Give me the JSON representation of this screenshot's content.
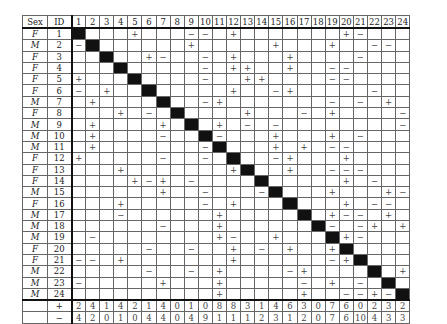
{
  "headers": {
    "sex": "Sex",
    "id": "ID",
    "columns": [
      "1",
      "2",
      "3",
      "4",
      "5",
      "6",
      "7",
      "8",
      "9",
      "10",
      "11",
      "12",
      "13",
      "14",
      "15",
      "16",
      "17",
      "18",
      "19",
      "20",
      "21",
      "22",
      "23",
      "24"
    ]
  },
  "rows": [
    {
      "sex": "F",
      "id": "1",
      "cells": {
        "5": "+",
        "9": "−",
        "10": "−",
        "12": "+",
        "20": "+",
        "21": "−"
      }
    },
    {
      "sex": "M",
      "id": "2",
      "cells": {
        "1": "−",
        "9": "+",
        "15": "+",
        "19": "+",
        "22": "−",
        "23": "−"
      }
    },
    {
      "sex": "F",
      "id": "3",
      "cells": {
        "6": "+",
        "7": "−",
        "10": "−",
        "12": "+",
        "16": "+",
        "21": "−"
      }
    },
    {
      "sex": "F",
      "id": "4",
      "cells": {
        "10": "−",
        "12": "+",
        "13": "+",
        "16": "+",
        "19": "−",
        "20": "−"
      }
    },
    {
      "sex": "F",
      "id": "5",
      "cells": {
        "1": "+",
        "10": "−",
        "13": "+",
        "14": "+",
        "19": "−",
        "20": "−"
      }
    },
    {
      "sex": "F",
      "id": "6",
      "cells": {
        "1": "−",
        "3": "+",
        "12": "+",
        "15": "−",
        "16": "+",
        "22": "−"
      }
    },
    {
      "sex": "M",
      "id": "7",
      "cells": {
        "2": "+",
        "10": "−",
        "11": "+",
        "19": "−",
        "21": "−",
        "23": "+"
      }
    },
    {
      "sex": "F",
      "id": "8",
      "cells": {
        "4": "+",
        "6": "−",
        "13": "+",
        "17": "−",
        "19": "+",
        "24": "−"
      }
    },
    {
      "sex": "M",
      "id": "9",
      "cells": {
        "2": "+",
        "7": "+",
        "11": "+",
        "13": "−",
        "15": "−",
        "24": "−"
      }
    },
    {
      "sex": "M",
      "id": "10",
      "cells": {
        "2": "+",
        "7": "−",
        "11": "−",
        "15": "+",
        "19": "+",
        "21": "−"
      }
    },
    {
      "sex": "M",
      "id": "11",
      "cells": {
        "2": "+",
        "10": "−",
        "15": "+",
        "17": "+",
        "19": "−",
        "20": "−"
      }
    },
    {
      "sex": "F",
      "id": "12",
      "cells": {
        "1": "+",
        "7": "−",
        "10": "−",
        "15": "−",
        "16": "+",
        "20": "+"
      }
    },
    {
      "sex": "F",
      "id": "13",
      "cells": {
        "4": "+",
        "12": "+",
        "16": "+",
        "19": "−",
        "20": "−",
        "21": "−"
      }
    },
    {
      "sex": "F",
      "id": "14",
      "cells": {
        "5": "+",
        "6": "−",
        "7": "+",
        "9": "−",
        "20": "+",
        "22": "−"
      }
    },
    {
      "sex": "M",
      "id": "15",
      "cells": {
        "7": "+",
        "10": "−",
        "14": "−",
        "19": "+",
        "23": "+",
        "24": "−"
      }
    },
    {
      "sex": "F",
      "id": "16",
      "cells": {
        "4": "+",
        "10": "−",
        "12": "+",
        "20": "+",
        "22": "−",
        "23": "−"
      }
    },
    {
      "sex": "M",
      "id": "17",
      "cells": {
        "4": "−",
        "11": "+",
        "19": "+",
        "20": "−",
        "21": "−",
        "23": "+"
      }
    },
    {
      "sex": "M",
      "id": "18",
      "cells": {
        "7": "−",
        "11": "+",
        "19": "−",
        "21": "−",
        "22": "+",
        "24": "+"
      }
    },
    {
      "sex": "M",
      "id": "19",
      "cells": {
        "2": "−",
        "11": "+",
        "12": "−",
        "15": "+",
        "20": "+",
        "21": "−"
      }
    },
    {
      "sex": "F",
      "id": "20",
      "cells": {
        "6": "−",
        "9": "−",
        "12": "+",
        "14": "−",
        "16": "+",
        "19": "+"
      }
    },
    {
      "sex": "F",
      "id": "21",
      "cells": {
        "1": "−",
        "2": "−",
        "4": "+",
        "12": "+",
        "19": "−",
        "20": "+"
      }
    },
    {
      "sex": "M",
      "id": "22",
      "cells": {
        "6": "−",
        "9": "−",
        "11": "+",
        "16": "−",
        "17": "+",
        "24": "+"
      }
    },
    {
      "sex": "M",
      "id": "23",
      "cells": {
        "1": "−",
        "7": "+",
        "11": "+",
        "17": "−",
        "19": "+",
        "21": "−"
      }
    },
    {
      "sex": "M",
      "id": "24",
      "cells": {
        "11": "+",
        "17": "+",
        "20": "−",
        "21": "−",
        "22": "+",
        "23": "−"
      }
    }
  ],
  "totals": [
    {
      "label": "+",
      "values": [
        "2",
        "4",
        "1",
        "4",
        "2",
        "1",
        "4",
        "0",
        "1",
        "0",
        "8",
        "8",
        "3",
        "1",
        "4",
        "6",
        "3",
        "0",
        "7",
        "6",
        "0",
        "2",
        "3",
        "2"
      ]
    },
    {
      "label": "−",
      "values": [
        "4",
        "2",
        "0",
        "1",
        "0",
        "4",
        "4",
        "0",
        "4",
        "9",
        "1",
        "1",
        "1",
        "2",
        "3",
        "1",
        "2",
        "0",
        "7",
        "6",
        "10",
        "4",
        "3",
        "3"
      ]
    }
  ]
}
